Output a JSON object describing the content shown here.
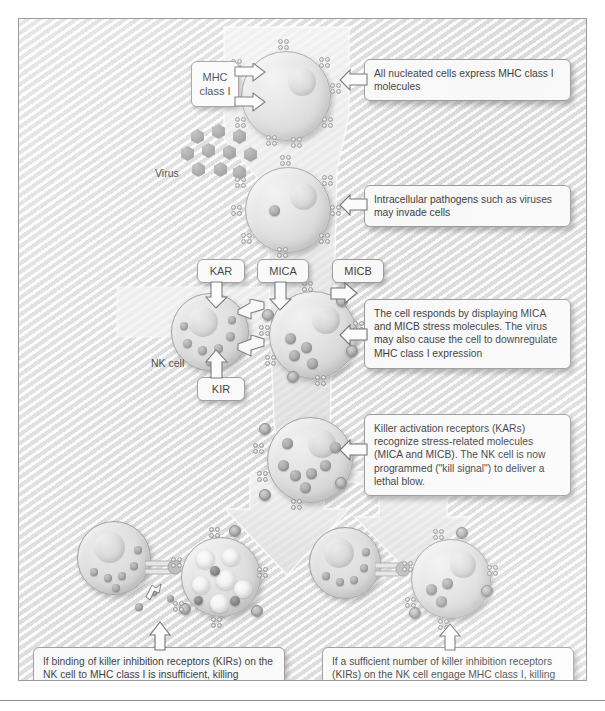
{
  "figure": {
    "domain": "biology-diagram",
    "palette": {
      "background": "#ededed",
      "border": "#9b9b9b",
      "callout_bg": "#fcfcfc",
      "callout_border": "#8d8d8d",
      "text": "#18181a",
      "cell_fill": "#e2e2e2"
    }
  },
  "callouts": [
    {
      "id": "c1",
      "text": "All nucleated cells express MHC class I molecules"
    },
    {
      "id": "c2",
      "text": "Intracellular pathogens such as viruses may invade cells"
    },
    {
      "id": "c3",
      "text": "The cell responds by displaying MICA and MICB stress molecules. The virus may also cause the cell to downregulate MHC class I expression"
    },
    {
      "id": "c4",
      "text": "Killer activation receptors (KARs) recognize stress-related molecules (MICA and MICB).  The NK cell is now programmed (\"kill signal\") to deliver a lethal blow."
    },
    {
      "id": "c5",
      "text": "If binding of killer inhibition receptors (KIRs) on the NK cell to MHC class I is insufficient, killing proceeds and the cell is terminated."
    },
    {
      "id": "c6",
      "text": "If a sufficient number of killer inhibition receptors (KIRs) on the NK cell engage MHC class I, killing is aborted and the targeted cell survives."
    }
  ],
  "labels": {
    "mhc_class_i": "MHC\nclass I",
    "mhc_class_i_line1": "MHC",
    "mhc_class_i_line2": "class I",
    "kar": "KAR",
    "kir": "KIR",
    "mica": "MICA",
    "micb": "MICB",
    "virus": "Virus",
    "nk_cell": "NK cell"
  },
  "structures": {
    "cell_1_name": "nucleated cell expressing MHC class I",
    "cell_2_name": "virus-infected cell",
    "cell_3_name": "stressed cell displaying MICA and MICB",
    "cell_4_name": "stressed cell engaged by NK cell",
    "cell_5_name": "terminated target cell",
    "cell_6_name": "surviving target cell",
    "nk_left_name": "natural killer cell with KAR and KIR",
    "nk_bottom_left_name": "natural killer cell delivering lethal blow",
    "nk_bottom_right_name": "natural killer cell with killing aborted"
  }
}
